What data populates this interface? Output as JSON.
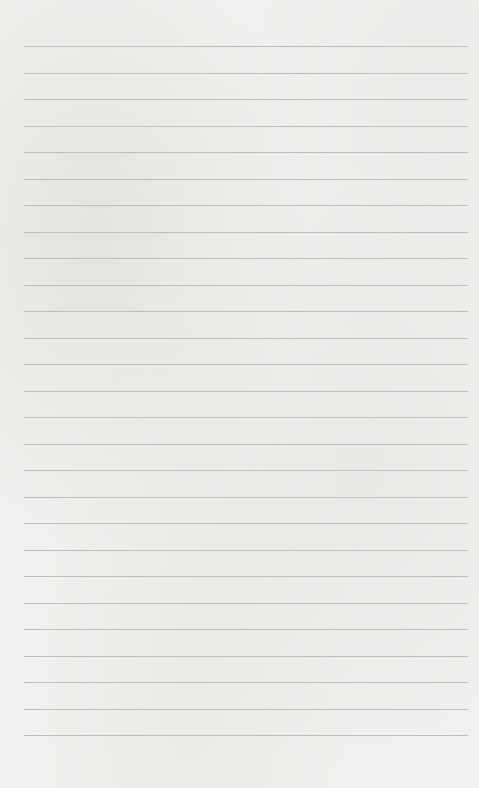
{
  "page": {
    "type": "lined-paper",
    "line_count": 27,
    "first_line_y": 46,
    "line_spacing": 26.5,
    "line_color": "#bdbcba",
    "background_color": "#f1f0ee"
  }
}
